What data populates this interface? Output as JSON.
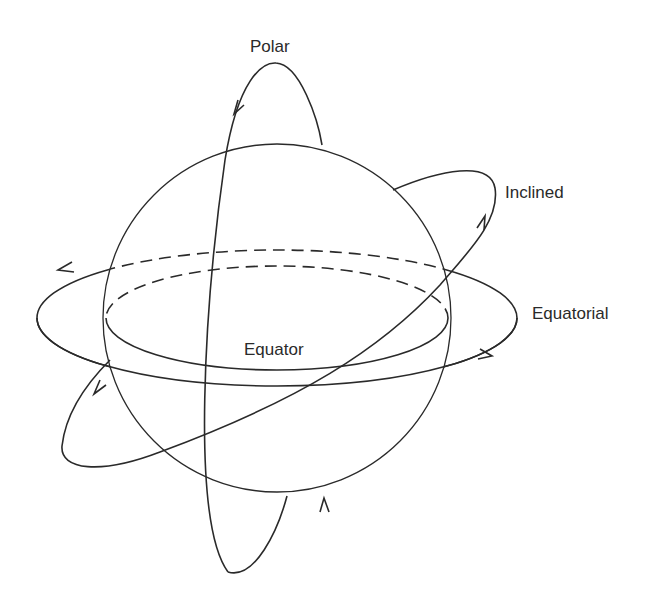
{
  "diagram": {
    "type": "orbit-types",
    "labels": {
      "polar": "Polar",
      "inclined": "Inclined",
      "equatorial": "Equatorial",
      "equator": "Equator"
    },
    "elements": [
      {
        "id": "globe",
        "shape": "circle"
      },
      {
        "id": "equator",
        "shape": "ellipse",
        "back_half": "dashed"
      },
      {
        "id": "equatorial-orbit",
        "shape": "ellipse",
        "back_half": "dashed",
        "direction_arrows": 2
      },
      {
        "id": "polar-orbit",
        "shape": "ellipse",
        "direction_arrows": 2
      },
      {
        "id": "inclined-orbit",
        "shape": "ellipse",
        "direction_arrows": 2
      }
    ],
    "stroke_color": "#2a2a2a",
    "background": "#ffffff"
  }
}
